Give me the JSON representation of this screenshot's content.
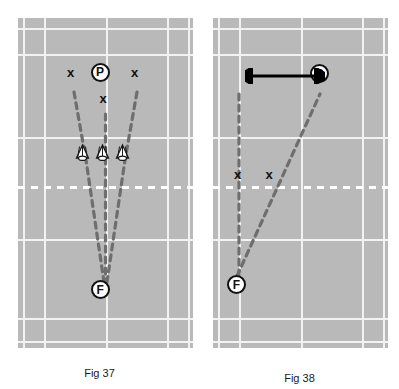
{
  "page": {
    "background_color": "#ffffff",
    "width": 399,
    "height": 389
  },
  "colors": {
    "court_surface": "#b9b9b9",
    "court_line": "#f2f2f2",
    "net_line": "#ffffff",
    "marker_stroke": "#111111",
    "marker_fill": "#ffffff",
    "trajectory": "#6e6e6e",
    "arrow": "#000000"
  },
  "figures": [
    {
      "id": "fig37",
      "caption": "Fig 37",
      "description": "Badminton court diagram with player P at the net hitting three straight shuttles to feeder F at the rear, with three X target markers",
      "court": {
        "lines": [
          {
            "name": "left-doubles-sideline",
            "orientation": "vertical",
            "x_pct": 3
          },
          {
            "name": "left-singles-sideline",
            "orientation": "vertical",
            "x_pct": 15
          },
          {
            "name": "centre-line",
            "orientation": "vertical",
            "x_pct": 50
          },
          {
            "name": "right-singles-sideline",
            "orientation": "vertical",
            "x_pct": 85
          },
          {
            "name": "right-doubles-sideline",
            "orientation": "vertical",
            "x_pct": 97
          },
          {
            "name": "top-doubles-long-service-line",
            "orientation": "horizontal",
            "y_pct": 3
          },
          {
            "name": "top-baseline",
            "orientation": "horizontal",
            "y_pct": 11
          },
          {
            "name": "top-short-service-line",
            "orientation": "horizontal",
            "y_pct": 36
          },
          {
            "name": "bottom-short-service-line",
            "orientation": "horizontal",
            "y_pct": 67
          },
          {
            "name": "bottom-baseline",
            "orientation": "horizontal",
            "y_pct": 91
          },
          {
            "name": "bottom-doubles-long-service-line",
            "orientation": "horizontal",
            "y_pct": 98
          }
        ],
        "net": {
          "name": "net",
          "orientation": "horizontal",
          "y_pct": 51,
          "style": "dashed-white"
        }
      },
      "markers": [
        {
          "label": "P",
          "type": "circle",
          "name": "player-marker",
          "x_pct": 50,
          "y_pct": 18
        },
        {
          "label": "F",
          "type": "circle",
          "name": "feeder-marker",
          "x_pct": 50,
          "y_pct": 82
        },
        {
          "label": "x",
          "type": "cross",
          "name": "target-left",
          "x_pct": 32,
          "y_pct": 18
        },
        {
          "label": "x",
          "type": "cross",
          "name": "target-centre",
          "x_pct": 50,
          "y_pct": 26
        },
        {
          "label": "x",
          "type": "cross",
          "name": "target-right",
          "x_pct": 68,
          "y_pct": 18
        }
      ],
      "shuttles": [
        {
          "name": "shuttle-left",
          "x_pct": 39,
          "y_pct": 43
        },
        {
          "name": "shuttle-centre",
          "x_pct": 50,
          "y_pct": 43
        },
        {
          "name": "shuttle-right",
          "x_pct": 61,
          "y_pct": 43
        }
      ],
      "trajectories": [
        {
          "name": "trajectory-left",
          "from": [
            32,
            22
          ],
          "via": [
            39,
            43
          ],
          "to": [
            49,
            80
          ]
        },
        {
          "name": "trajectory-centre",
          "from": [
            50,
            29
          ],
          "via": [
            50,
            43
          ],
          "to": [
            50,
            80
          ]
        },
        {
          "name": "trajectory-right",
          "from": [
            68,
            22
          ],
          "via": [
            61,
            43
          ],
          "to": [
            51,
            80
          ]
        }
      ],
      "arrows": []
    },
    {
      "id": "fig38",
      "caption": "Fig 38",
      "description": "Badminton court diagram with player P moving sideways along a double-headed arrow, two shuttle trajectories rising from feeder F at the rear corner, two X markers near the net",
      "court": {
        "lines": [
          {
            "name": "left-doubles-sideline",
            "orientation": "vertical",
            "x_pct": 3
          },
          {
            "name": "left-singles-sideline",
            "orientation": "vertical",
            "x_pct": 15
          },
          {
            "name": "centre-line",
            "orientation": "vertical",
            "x_pct": 50
          },
          {
            "name": "right-singles-sideline",
            "orientation": "vertical",
            "x_pct": 85
          },
          {
            "name": "right-doubles-sideline",
            "orientation": "vertical",
            "x_pct": 97
          },
          {
            "name": "top-doubles-long-service-line",
            "orientation": "horizontal",
            "y_pct": 3
          },
          {
            "name": "top-baseline",
            "orientation": "horizontal",
            "y_pct": 11
          },
          {
            "name": "top-short-service-line",
            "orientation": "horizontal",
            "y_pct": 36
          },
          {
            "name": "bottom-short-service-line",
            "orientation": "horizontal",
            "y_pct": 67
          },
          {
            "name": "bottom-baseline",
            "orientation": "horizontal",
            "y_pct": 91
          },
          {
            "name": "bottom-doubles-long-service-line",
            "orientation": "horizontal",
            "y_pct": 98
          }
        ],
        "net": {
          "name": "net",
          "orientation": "horizontal",
          "y_pct": 51,
          "style": "dashed-white"
        }
      },
      "markers": [
        {
          "label": "P",
          "type": "circle",
          "name": "player-marker",
          "x_pct": 63,
          "y_pct": 19
        },
        {
          "label": "F",
          "type": "circle",
          "name": "feeder-marker",
          "x_pct": 15,
          "y_pct": 81
        },
        {
          "label": "x",
          "type": "cross",
          "name": "target-left",
          "x_pct": 16,
          "y_pct": 47
        },
        {
          "label": "x",
          "type": "cross",
          "name": "target-right",
          "x_pct": 33,
          "y_pct": 47
        }
      ],
      "shuttles": [],
      "trajectories": [
        {
          "name": "trajectory-straight",
          "from": [
            15,
            78
          ],
          "to": [
            15,
            22
          ]
        },
        {
          "name": "trajectory-crosscourt",
          "from": [
            14,
            78
          ],
          "to": [
            61,
            23
          ]
        }
      ],
      "arrows": [
        {
          "name": "movement-arrow",
          "type": "double-headed",
          "from_pct": [
            22,
            19
          ],
          "to_pct": [
            59,
            19
          ]
        }
      ]
    }
  ]
}
